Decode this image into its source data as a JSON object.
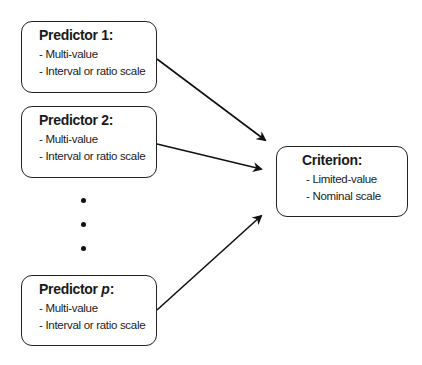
{
  "diagram": {
    "predictors": [
      {
        "title": "Predictor 1:",
        "title_prefix": "Predictor ",
        "title_var": "1",
        "title_suffix": ":",
        "items": [
          "- Multi-value",
          "- Interval or ratio scale"
        ]
      },
      {
        "title": "Predictor 2:",
        "title_prefix": "Predictor ",
        "title_var": "2",
        "title_suffix": ":",
        "items": [
          "- Multi-value",
          "- Interval or ratio scale"
        ]
      },
      {
        "title": "Predictor p:",
        "title_prefix": "Predictor ",
        "title_var": "p",
        "title_suffix": ":",
        "items": [
          "- Multi-value",
          "- Interval or ratio scale"
        ]
      }
    ],
    "ellipsis_dots": 3,
    "criterion": {
      "title": "Criterion:",
      "items": [
        "- Limited-value",
        "- Nominal scale"
      ]
    },
    "edges": [
      {
        "from": "Predictor 1",
        "to": "Criterion"
      },
      {
        "from": "Predictor 2",
        "to": "Criterion"
      },
      {
        "from": "Predictor p",
        "to": "Criterion"
      }
    ],
    "colors": {
      "stroke": "#222222",
      "background": "#ffffff"
    }
  }
}
